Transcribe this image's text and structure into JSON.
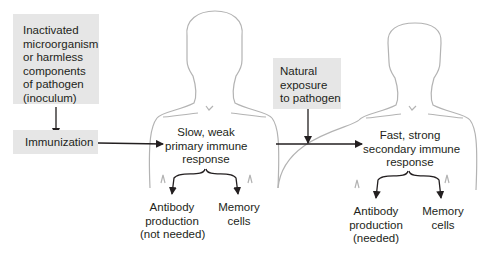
{
  "diagram": {
    "inoculum_box": {
      "lines": [
        "Inactivated",
        "microorganism",
        "or harmless",
        "components",
        "of pathogen",
        "(inoculum)"
      ]
    },
    "immunization_box": {
      "label": "Immunization"
    },
    "natural_exposure_box": {
      "lines": [
        "Natural",
        "exposure",
        "to pathogen"
      ]
    },
    "primary_person": {
      "response": [
        "Slow, weak",
        "primary immune",
        "response"
      ],
      "outcome_left": [
        "Antibody",
        "production",
        "(not needed)"
      ],
      "outcome_right": [
        "Memory",
        "cells"
      ]
    },
    "secondary_person": {
      "response": [
        "Fast, strong",
        "secondary immune",
        "response"
      ],
      "outcome_left": [
        "Antibody",
        "production",
        "(needed)"
      ],
      "outcome_right": [
        "Memory",
        "cells"
      ]
    },
    "colors": {
      "box_fill": "#e6e6e6",
      "outline": "#b3b3b3",
      "arrow": "#231f20"
    }
  }
}
